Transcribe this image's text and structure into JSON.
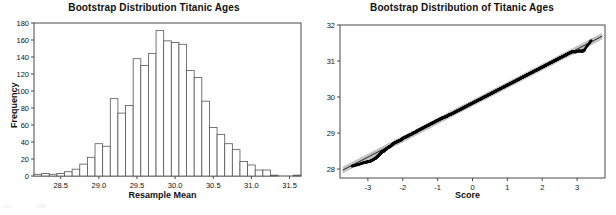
{
  "figure": {
    "panels": [
      "histogram",
      "probability-plot"
    ]
  },
  "chart_data": [
    {
      "type": "bar",
      "title": "Bootstrap Distribution Titanic Ages",
      "xlabel": "Resample Mean",
      "ylabel": "Frequency",
      "xlim": [
        28.15,
        31.65
      ],
      "ylim": [
        0,
        180
      ],
      "xticks": [
        28.5,
        29.0,
        29.5,
        30.0,
        30.5,
        31.0,
        31.5
      ],
      "xtick_labels": [
        "28.5",
        "29.0",
        "29.5",
        "30.0",
        "30.5",
        "31.0",
        "31.5"
      ],
      "yticks": [
        0,
        20,
        40,
        60,
        80,
        100,
        120,
        140,
        160,
        180
      ],
      "ytick_labels": [
        "0",
        "20",
        "40",
        "60",
        "80",
        "100",
        "120",
        "140",
        "160",
        "180"
      ],
      "grid": false,
      "legend": null,
      "bin_width": 0.1,
      "bin_starts": [
        28.15,
        28.25,
        28.35,
        28.45,
        28.55,
        28.65,
        28.75,
        28.85,
        28.95,
        29.05,
        29.15,
        29.25,
        29.35,
        29.45,
        29.55,
        29.65,
        29.75,
        29.85,
        29.95,
        30.05,
        30.15,
        30.25,
        30.35,
        30.45,
        30.55,
        30.65,
        30.75,
        30.85,
        30.95,
        31.05,
        31.15,
        31.25,
        31.35,
        31.45,
        31.55
      ],
      "categories": [
        "28.2",
        "28.3",
        "28.4",
        "28.5",
        "28.6",
        "28.7",
        "28.8",
        "28.9",
        "29.0",
        "29.1",
        "29.2",
        "29.3",
        "29.4",
        "29.5",
        "29.6",
        "29.7",
        "29.8",
        "29.9",
        "30.0",
        "30.1",
        "30.2",
        "30.3",
        "30.4",
        "30.5",
        "30.6",
        "30.7",
        "30.8",
        "30.9",
        "31.0",
        "31.1",
        "31.2",
        "31.3",
        "31.4",
        "31.5",
        "31.6"
      ],
      "values": [
        2,
        3,
        2,
        3,
        5,
        8,
        14,
        22,
        38,
        35,
        91,
        74,
        83,
        138,
        130,
        144,
        171,
        159,
        157,
        155,
        124,
        116,
        88,
        57,
        49,
        38,
        31,
        17,
        13,
        7,
        7,
        1,
        0,
        0,
        1
      ]
    },
    {
      "type": "scatter",
      "title": "Bootstrap Distribution of Titanic Ages",
      "xlabel": "Score",
      "ylabel": "",
      "xlim": [
        -3.8,
        3.8
      ],
      "ylim": [
        27.75,
        32.0
      ],
      "xticks": [
        -3,
        -2,
        -1,
        0,
        1,
        2,
        3
      ],
      "xtick_labels": [
        "-3",
        "-2",
        "-1",
        "0",
        "1",
        "2",
        "3"
      ],
      "yticks": [
        28,
        29,
        30,
        31,
        32
      ],
      "ytick_labels": [
        "28",
        "29",
        "30",
        "31",
        "32"
      ],
      "grid": false,
      "legend": null,
      "fit_line": {
        "intercept": 29.83,
        "slope": 0.5
      },
      "confidence_band_offsets": [
        -0.075,
        0.075
      ],
      "x": [
        -3.45,
        -3.25,
        -3.1,
        -3.0,
        -2.92,
        -2.85,
        -2.78,
        -2.72,
        -2.66,
        -2.6,
        -2.54,
        -2.48,
        -2.42,
        -2.36,
        -2.3,
        -2.24,
        -2.18,
        -2.12,
        -2.06,
        -2.0,
        -1.94,
        -1.88,
        -1.82,
        -1.76,
        -1.7,
        -1.64,
        -1.58,
        -1.52,
        -1.46,
        -1.4,
        -1.34,
        -1.28,
        -1.22,
        -1.16,
        -1.1,
        -1.04,
        -0.98,
        -0.92,
        -0.86,
        -0.8,
        -0.74,
        -0.68,
        -0.62,
        -0.56,
        -0.5,
        -0.44,
        -0.38,
        -0.32,
        -0.26,
        -0.2,
        -0.14,
        -0.08,
        -0.02,
        0.04,
        0.1,
        0.16,
        0.22,
        0.28,
        0.34,
        0.4,
        0.46,
        0.52,
        0.58,
        0.64,
        0.7,
        0.76,
        0.82,
        0.88,
        0.94,
        1.0,
        1.06,
        1.12,
        1.18,
        1.24,
        1.3,
        1.36,
        1.42,
        1.48,
        1.54,
        1.6,
        1.66,
        1.72,
        1.78,
        1.84,
        1.9,
        1.96,
        2.02,
        2.08,
        2.14,
        2.2,
        2.26,
        2.32,
        2.38,
        2.44,
        2.5,
        2.56,
        2.62,
        2.68,
        2.74,
        2.8,
        2.86,
        2.95,
        3.05,
        3.15,
        3.2,
        3.4
      ],
      "y": [
        28.08,
        28.13,
        28.18,
        28.2,
        28.22,
        28.26,
        28.3,
        28.35,
        28.41,
        28.47,
        28.5,
        28.55,
        28.6,
        28.63,
        28.68,
        28.72,
        28.75,
        28.78,
        28.8,
        28.85,
        28.88,
        28.9,
        28.94,
        28.96,
        29.0,
        29.02,
        29.06,
        29.09,
        29.12,
        29.15,
        29.18,
        29.21,
        29.24,
        29.27,
        29.3,
        29.33,
        29.36,
        29.39,
        29.42,
        29.44,
        29.46,
        29.5,
        29.52,
        29.55,
        29.58,
        29.61,
        29.64,
        29.67,
        29.7,
        29.73,
        29.76,
        29.79,
        29.82,
        29.85,
        29.88,
        29.91,
        29.94,
        29.97,
        30.0,
        30.03,
        30.06,
        30.09,
        30.12,
        30.15,
        30.18,
        30.21,
        30.24,
        30.27,
        30.3,
        30.33,
        30.36,
        30.39,
        30.42,
        30.45,
        30.48,
        30.51,
        30.54,
        30.57,
        30.6,
        30.63,
        30.66,
        30.69,
        30.72,
        30.75,
        30.78,
        30.81,
        30.84,
        30.87,
        30.9,
        30.93,
        30.96,
        30.99,
        31.02,
        31.05,
        31.08,
        31.11,
        31.14,
        31.17,
        31.2,
        31.23,
        31.26,
        31.25,
        31.28,
        31.27,
        31.3,
        31.56
      ]
    }
  ]
}
